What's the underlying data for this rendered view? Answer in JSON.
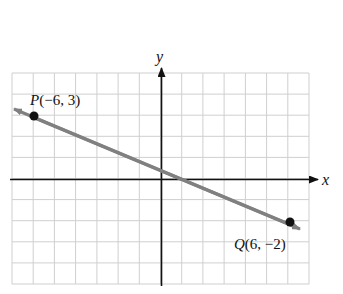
{
  "chart_data": {
    "type": "line",
    "title": "",
    "xlabel": "x",
    "ylabel": "y",
    "xlim": [
      -7,
      7
    ],
    "ylim": [
      -5,
      5
    ],
    "grid": true,
    "grid_step": 1,
    "tick_labels": false,
    "series": [
      {
        "name": "line PQ",
        "color": "#808080",
        "x": [
          -6,
          6
        ],
        "y": [
          3,
          -2
        ],
        "extends_beyond_points": true
      }
    ],
    "points": [
      {
        "name": "P",
        "x": -6,
        "y": 3,
        "label": "P(−6, 3)"
      },
      {
        "name": "Q",
        "x": 6,
        "y": -2,
        "label": "Q(6, −2)"
      }
    ]
  },
  "labels": {
    "x_axis": "x",
    "y_axis": "y",
    "point_p_letter": "P",
    "point_p_coords": "(−6, 3)",
    "point_q_letter": "Q",
    "point_q_coords": "(6, −2)"
  },
  "colors": {
    "grid": "#cfcfcf",
    "axes": "#111111",
    "line": "#808080",
    "points": "#111111"
  }
}
